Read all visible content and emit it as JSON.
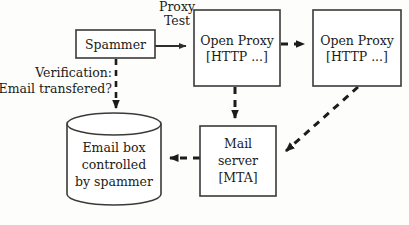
{
  "diagram": {
    "background_color": "#fdfdfc",
    "stroke_color": "#3a3a38",
    "text_color": "#1b1b19",
    "nodes": {
      "spammer": {
        "label": "Spammer",
        "shape": "rectangle",
        "x": 76,
        "y": 30,
        "w": 79,
        "h": 28
      },
      "open_proxy_1": {
        "line1": "Open Proxy",
        "line2": "[HTTP ...]",
        "shape": "rectangle",
        "x": 194,
        "y": 10,
        "w": 86,
        "h": 76
      },
      "open_proxy_2": {
        "line1": "Open Proxy",
        "line2": "[HTTP ...]",
        "shape": "rectangle",
        "x": 313,
        "y": 10,
        "w": 88,
        "h": 76
      },
      "mail_server": {
        "line1": "Mail",
        "line2": "server",
        "line3": "[MTA]",
        "shape": "rectangle",
        "x": 200,
        "y": 126,
        "w": 76,
        "h": 70
      },
      "email_box": {
        "line1": "Email box",
        "line2": "controlled",
        "line3": "by spammer",
        "shape": "cylinder",
        "x": 67,
        "y": 113,
        "w": 94,
        "h": 92
      }
    },
    "edges": {
      "spammer_to_proxy1": {
        "label_line1": "Proxy",
        "label_line2": "Test",
        "style": "solid",
        "arrow": "end"
      },
      "proxy1_to_proxy2": {
        "label": "",
        "style": "dashed",
        "arrow": "end"
      },
      "proxy1_to_mailserver": {
        "label": "",
        "style": "dashed",
        "arrow": "end"
      },
      "proxy2_to_mailserver": {
        "label": "",
        "style": "dashed",
        "arrow": "end"
      },
      "mailserver_to_emailbox": {
        "label": "",
        "style": "dashed",
        "arrow": "end"
      },
      "spammer_to_emailbox": {
        "label_line1": "Verification:",
        "label_line2": "Email transfered?",
        "style": "dashed",
        "arrow": "end"
      }
    }
  }
}
